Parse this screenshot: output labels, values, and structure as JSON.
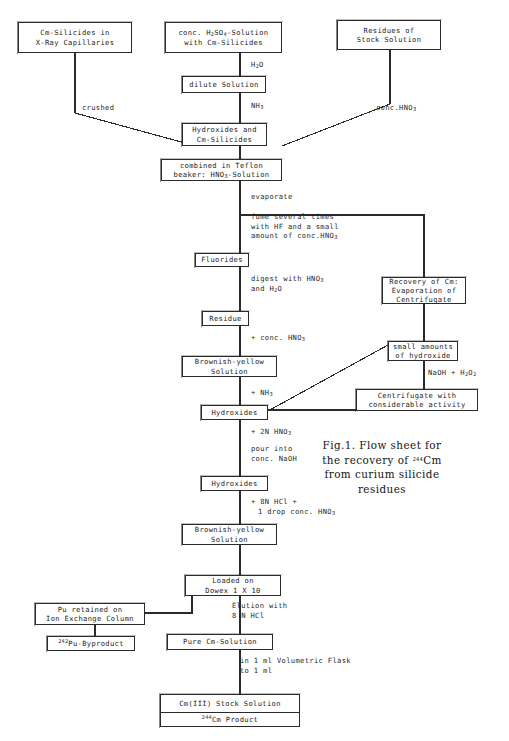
{
  "figure": {
    "caption_lines": [
      "Fig.1. Flow sheet for",
      "the recovery of ²⁴⁴Cm",
      "from curium silicide",
      "residues"
    ],
    "caption_plain": "Fig.1. Flow sheet for the recovery of 244Cm from curium silicide residues"
  },
  "boxes": {
    "cm_silicides_capillaries": {
      "line1": "Cm-Silicides in",
      "line2": "X-Ray Capillaries"
    },
    "conc_h2so4_solution": {
      "line1": "conc. H₂SO₄-Solution",
      "line2": "with Cm-Silicides"
    },
    "residues_stock_solution": {
      "line1": "Residues of",
      "line2": "Stock Solution"
    },
    "dilute_solution": {
      "line1": "dilute Solution"
    },
    "hydroxides_and_cm_silicides": {
      "line1": "Hydroxides and",
      "line2": "Cm-Silicides"
    },
    "combined_teflon_beaker": {
      "line1": "combined in Teflon",
      "line2": "beaker: HNO₃-Solution"
    },
    "fluorides": {
      "line1": "Fluorides"
    },
    "residue": {
      "line1": "Residue"
    },
    "brownish_yellow_solution_1": {
      "line1": "Brownish-yellow",
      "line2": "Solution"
    },
    "hydroxides_1": {
      "line1": "Hydroxides"
    },
    "hydroxides_2": {
      "line1": "Hydroxides"
    },
    "brownish_yellow_solution_2": {
      "line1": "Brownish-yellow",
      "line2": "Solution"
    },
    "recovery_of_cm": {
      "line1": "Recovery of Cm:",
      "line2": "Evaporation of",
      "line3": "Centrifugate"
    },
    "small_amounts_hydroxide": {
      "line1": "small amounts",
      "line2": "of hydroxide"
    },
    "centrifugate_activity": {
      "line1": "Centrifugate with",
      "line2": "considerable activity"
    },
    "loaded_on_dowex": {
      "line1": "Loaded on",
      "line2": "Dowex 1 X 10"
    },
    "pu_retained": {
      "line1": "Pu retained on",
      "line2": "Ion Exchange Column"
    },
    "pu_byproduct": {
      "mass": "242",
      "text": "Pu-Byproduct"
    },
    "pure_cm_solution": {
      "line1": "Pure Cm-Solution"
    },
    "cm_stock_solution": {
      "line1": "Cm(III) Stock Solution"
    },
    "cm_product": {
      "mass": "244",
      "text": "Cm Product"
    }
  },
  "labels": {
    "h2o": "H₂O",
    "nh3_top": "NH₃",
    "crushed": "crushed",
    "conc_hno3_right": "conc.HNO₃",
    "evaporate": "evaporate",
    "fume_l1": "fume several times",
    "fume_l2": "with HF and a small",
    "fume_l3": "amount of conc.HNO₃",
    "digest_l1": "digest with HNO₃",
    "digest_l2": "and H₂O",
    "plus_conc_hno3": "+ conc. HNO₃",
    "plus_nh3": "+ NH₃",
    "naoh_h2o2": "NaOH + H₂O₂",
    "plus_2n_hno3": "+ 2N HNO₃",
    "pour_into_l1": "pour into",
    "pour_into_l2": "conc. NaOH",
    "plus_8n_hcl_l1": "+ 8N HCl +",
    "plus_8n_hcl_l2": "1 drop conc. HNO₃",
    "elution_l1": "Elution with",
    "elution_l2": "8 N HCl",
    "volumetric_l1": "in 1 ml Volumetric Flask",
    "volumetric_l2": "to 1 ml"
  },
  "colors": {
    "stroke": "#2b2b2b",
    "text": "#1a1a1a",
    "background": "#ffffff"
  }
}
